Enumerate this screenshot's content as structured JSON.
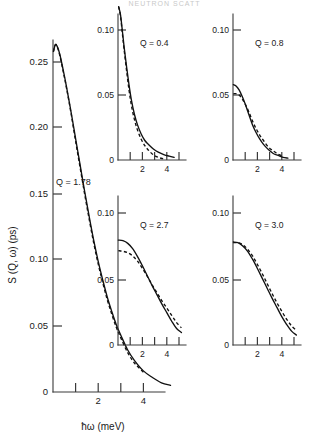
{
  "figure": {
    "header_fragment": "NEUTRON SCATT",
    "axis": {
      "ylabel": "S (Q, ω)  (ps)",
      "xlabel": "ħω  (meV)"
    }
  },
  "chart_data": [
    {
      "type": "line",
      "title": "",
      "panel_label": "Q = 1.78",
      "xlabel": "ħω  (meV)",
      "ylabel": "S (Q, ω)  (ps)",
      "xlim": [
        0,
        5.2
      ],
      "ylim": [
        0,
        0.275
      ],
      "xticks": [
        1,
        2,
        3,
        4
      ],
      "xtick_labels": [
        "",
        "2",
        "",
        "4"
      ],
      "yticks": [
        0,
        0.05,
        0.1,
        0.15,
        0.2,
        0.25
      ],
      "ytick_labels": [
        "0",
        "0.05",
        "0.10",
        "0.15",
        "0.20",
        "0.25"
      ],
      "grid": false,
      "legend": "none",
      "series": [
        {
          "name": "solid",
          "style": "solid",
          "x": [
            0.02,
            0.1,
            0.18,
            0.3,
            0.45,
            0.6,
            0.8,
            1.0,
            1.2,
            1.4,
            1.6,
            1.8,
            2.0,
            2.2,
            2.4,
            2.6,
            2.8,
            3.0,
            3.3,
            3.6,
            4.0,
            4.4,
            4.8,
            5.2
          ],
          "y": [
            0.258,
            0.263,
            0.262,
            0.256,
            0.244,
            0.231,
            0.212,
            0.192,
            0.172,
            0.152,
            0.133,
            0.115,
            0.099,
            0.085,
            0.072,
            0.061,
            0.051,
            0.043,
            0.032,
            0.024,
            0.016,
            0.011,
            0.007,
            0.005
          ]
        },
        {
          "name": "dashed",
          "style": "dashed",
          "x": [
            0.02,
            0.1,
            0.18,
            0.3,
            0.45,
            0.6,
            0.8,
            1.0,
            1.2,
            1.4,
            1.6,
            1.8,
            2.0,
            2.2,
            2.4,
            2.6,
            2.8,
            3.0,
            3.3,
            3.6,
            4.0
          ],
          "y": [
            0.258,
            0.263,
            0.262,
            0.255,
            0.243,
            0.23,
            0.211,
            0.19,
            0.17,
            0.15,
            0.131,
            0.113,
            0.097,
            0.083,
            0.07,
            0.059,
            0.049,
            0.041,
            0.03,
            0.022,
            0.015
          ]
        }
      ]
    },
    {
      "type": "line",
      "panel_label": "Q = 0.4",
      "xlim": [
        0,
        5.4
      ],
      "ylim": [
        0,
        0.125
      ],
      "xticks": [
        1,
        2,
        3,
        4,
        5
      ],
      "xtick_labels": [
        "",
        "2",
        "",
        "4",
        ""
      ],
      "yticks": [
        0,
        0.05,
        0.1
      ],
      "ytick_labels": [
        "0",
        "0.05",
        "0.10"
      ],
      "grid": false,
      "legend": "none",
      "series": [
        {
          "name": "solid",
          "style": "solid",
          "x": [
            0.05,
            0.2,
            0.35,
            0.5,
            0.7,
            0.9,
            1.1,
            1.35,
            1.6,
            1.9,
            2.2,
            2.5,
            2.9,
            3.3,
            3.8,
            4.2,
            4.6
          ],
          "y": [
            0.118,
            0.112,
            0.1,
            0.087,
            0.072,
            0.058,
            0.046,
            0.035,
            0.027,
            0.02,
            0.015,
            0.012,
            0.0085,
            0.006,
            0.004,
            0.003,
            0.002
          ]
        },
        {
          "name": "dashed",
          "style": "dashed",
          "x": [
            0.05,
            0.2,
            0.35,
            0.5,
            0.7,
            0.9,
            1.1,
            1.35,
            1.6,
            1.9,
            2.2,
            2.5,
            2.9,
            3.3,
            3.7
          ],
          "y": [
            0.118,
            0.111,
            0.098,
            0.085,
            0.069,
            0.054,
            0.042,
            0.031,
            0.023,
            0.016,
            0.011,
            0.0075,
            0.004,
            0.002,
            0.001
          ]
        }
      ]
    },
    {
      "type": "line",
      "panel_label": "Q = 0.8",
      "xlim": [
        0,
        5.4
      ],
      "ylim": [
        0,
        0.125
      ],
      "xticks": [
        1,
        2,
        3,
        4,
        5
      ],
      "xtick_labels": [
        "",
        "2",
        "",
        "4",
        ""
      ],
      "yticks": [
        0,
        0.05,
        0.1
      ],
      "ytick_labels": [
        "0",
        "0.05",
        "0.10"
      ],
      "grid": false,
      "legend": "none",
      "series": [
        {
          "name": "solid",
          "style": "solid",
          "x": [
            0.03,
            0.25,
            0.5,
            0.75,
            1.0,
            1.3,
            1.6,
            1.9,
            2.2,
            2.5,
            2.9,
            3.3,
            3.7,
            4.1,
            4.5
          ],
          "y": [
            0.058,
            0.057,
            0.054,
            0.049,
            0.043,
            0.035,
            0.027,
            0.021,
            0.016,
            0.012,
            0.008,
            0.005,
            0.0035,
            0.002,
            0.0015
          ]
        },
        {
          "name": "dashed",
          "style": "dashed",
          "x": [
            0.03,
            0.25,
            0.5,
            0.75,
            1.0,
            1.3,
            1.6,
            1.9,
            2.2,
            2.5,
            2.9,
            3.3,
            3.7,
            4.1
          ],
          "y": [
            0.051,
            0.051,
            0.05,
            0.047,
            0.043,
            0.037,
            0.03,
            0.024,
            0.019,
            0.015,
            0.01,
            0.007,
            0.0045,
            0.003
          ]
        }
      ]
    },
    {
      "type": "line",
      "panel_label": "Q = 2.7",
      "xlim": [
        0,
        5.4
      ],
      "ylim": [
        0,
        0.125
      ],
      "xticks": [
        1,
        2,
        3,
        4,
        5
      ],
      "xtick_labels": [
        "",
        "2",
        "",
        "4",
        ""
      ],
      "yticks": [
        0,
        0.05,
        0.1
      ],
      "ytick_labels": [
        "0",
        "0.05",
        "0.10"
      ],
      "grid": false,
      "legend": "none",
      "series": [
        {
          "name": "solid",
          "style": "solid",
          "x": [
            0.03,
            0.4,
            0.8,
            1.2,
            1.6,
            2.0,
            2.4,
            2.8,
            3.2,
            3.6,
            4.0,
            4.4,
            4.8,
            5.2
          ],
          "y": [
            0.0795,
            0.079,
            0.077,
            0.073,
            0.067,
            0.06,
            0.0525,
            0.045,
            0.038,
            0.031,
            0.0245,
            0.018,
            0.0125,
            0.0095
          ]
        },
        {
          "name": "dashed",
          "style": "dashed",
          "x": [
            0.03,
            0.4,
            0.8,
            1.2,
            1.6,
            2.0,
            2.4,
            2.8,
            3.2,
            3.6,
            4.0,
            4.4,
            4.8,
            5.2
          ],
          "y": [
            0.0715,
            0.071,
            0.07,
            0.0675,
            0.0635,
            0.058,
            0.052,
            0.0455,
            0.0395,
            0.0335,
            0.028,
            0.0225,
            0.017,
            0.013
          ]
        }
      ]
    },
    {
      "type": "line",
      "panel_label": "Q = 3.0",
      "xlim": [
        0,
        5.4
      ],
      "ylim": [
        0,
        0.125
      ],
      "xticks": [
        1,
        2,
        3,
        4,
        5
      ],
      "xtick_labels": [
        "",
        "2",
        "",
        "4",
        ""
      ],
      "yticks": [
        0,
        0.05,
        0.1
      ],
      "ytick_labels": [
        "0",
        "0.05",
        "0.10"
      ],
      "grid": false,
      "legend": "none",
      "series": [
        {
          "name": "solid",
          "style": "solid",
          "x": [
            0.03,
            0.4,
            0.8,
            1.2,
            1.6,
            2.0,
            2.4,
            2.8,
            3.2,
            3.6,
            4.0,
            4.4,
            4.8,
            5.2
          ],
          "y": [
            0.078,
            0.0775,
            0.075,
            0.071,
            0.065,
            0.058,
            0.0505,
            0.043,
            0.0355,
            0.0285,
            0.0215,
            0.0155,
            0.0105,
            0.0075
          ]
        },
        {
          "name": "dashed",
          "style": "dashed",
          "x": [
            0.03,
            0.4,
            0.8,
            1.2,
            1.6,
            2.0,
            2.4,
            2.8,
            3.2,
            3.6,
            4.0,
            4.4,
            4.8,
            5.2
          ],
          "y": [
            0.0775,
            0.0775,
            0.076,
            0.0725,
            0.0675,
            0.061,
            0.054,
            0.0465,
            0.039,
            0.032,
            0.0255,
            0.0195,
            0.0145,
            0.011
          ]
        }
      ]
    }
  ],
  "panels": {
    "main": {
      "label": "Q = 1.78",
      "ytick_labels": [
        "0.25",
        "0.20",
        "0.15",
        "0.10",
        "0.05",
        "0"
      ],
      "xtick_labels": [
        "2",
        "4"
      ],
      "ylabel": "S (Q, ω)  (ps)",
      "xlabel": "ħω  (meV)"
    },
    "inset_q04": {
      "label": "Q = 0.4",
      "ytick_labels": [
        "0.10",
        "0.05",
        "0"
      ],
      "xtick_labels": [
        "2",
        "4"
      ]
    },
    "inset_q08": {
      "label": "Q = 0.8",
      "ytick_labels": [
        "0.10",
        "0.05",
        "0"
      ],
      "xtick_labels": [
        "2",
        "4"
      ]
    },
    "inset_q27": {
      "label": "Q = 2.7",
      "ytick_labels": [
        "0.10",
        "0.05",
        "0"
      ],
      "xtick_labels": [
        "2",
        "4"
      ]
    },
    "inset_q30": {
      "label": "Q = 3.0",
      "ytick_labels": [
        "0.10",
        "0.05",
        "0"
      ],
      "xtick_labels": [
        "2",
        "4"
      ]
    }
  }
}
